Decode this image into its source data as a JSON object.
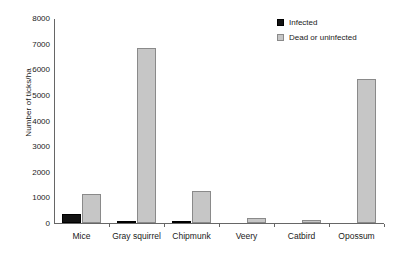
{
  "chart_data": {
    "type": "bar",
    "title": "",
    "xlabel": "",
    "ylabel": "Number of ticks/ha",
    "ylim": [
      0,
      8000
    ],
    "ytick_step": 1000,
    "yticks": [
      0,
      1000,
      2000,
      3000,
      4000,
      5000,
      6000,
      7000,
      8000
    ],
    "ytick_labels": [
      "0",
      "1000",
      "2000",
      "3000",
      "4000",
      "5000",
      "6000",
      "7000",
      "8000"
    ],
    "grid": false,
    "legend_position": "top-right",
    "categories": [
      "Mice",
      "Gray squirrel",
      "Chipmunk",
      "Veery",
      "Catbird",
      "Opossum"
    ],
    "series": [
      {
        "name": "Infected",
        "color": "#131313",
        "values": [
          350,
          50,
          90,
          0,
          0,
          0
        ]
      },
      {
        "name": "Dead or uninfected",
        "color": "#c6c6c6",
        "values": [
          1130,
          6830,
          1250,
          190,
          110,
          5620
        ]
      }
    ]
  },
  "legend": {
    "items": [
      {
        "label": "Infected",
        "swatch": "filled-black-square"
      },
      {
        "label": "Dead or uninfected",
        "swatch": "filled-gray-square"
      }
    ]
  },
  "axis": {
    "y_label": "Number of ticks/ha"
  },
  "colors": {
    "infected": "#131313",
    "dead_or_uninfected": "#c6c6c6",
    "axis": "#666666",
    "text": "#1a1a1a",
    "background": "#ffffff"
  }
}
